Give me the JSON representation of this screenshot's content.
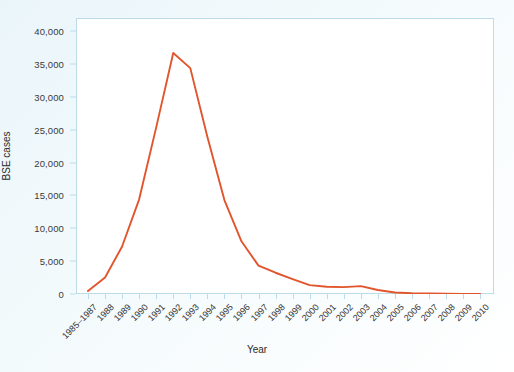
{
  "chart_data": {
    "type": "line",
    "title": "",
    "subtitle": "",
    "xlabel": "Year",
    "ylabel": "BSE cases",
    "categories": [
      "1985–1987",
      "1988",
      "1989",
      "1990",
      "1991",
      "1992",
      "1993",
      "1994",
      "1995",
      "1996",
      "1997",
      "1998",
      "1999",
      "2000",
      "2001",
      "2002",
      "2003",
      "2004",
      "2005",
      "2006",
      "2007",
      "2008",
      "2009",
      "2010"
    ],
    "values": [
      446,
      2514,
      7228,
      14407,
      25359,
      36682,
      34370,
      23945,
      14302,
      8016,
      4312,
      3235,
      2274,
      1357,
      1113,
      1044,
      1202,
      612,
      225,
      114,
      67,
      37,
      12,
      11
    ],
    "series": [
      {
        "name": "BSE cases",
        "color": "#e2552c",
        "values": [
          446,
          2514,
          7228,
          14407,
          25359,
          36682,
          34370,
          23945,
          14302,
          8016,
          4312,
          3235,
          2274,
          1357,
          1113,
          1044,
          1202,
          612,
          225,
          114,
          67,
          37,
          12,
          11
        ]
      }
    ],
    "ylim": [
      0,
      42000
    ],
    "yticks": [
      0,
      5000,
      10000,
      15000,
      20000,
      25000,
      30000,
      35000,
      40000
    ],
    "ytick_labels": [
      "0",
      "5,000",
      "10,000",
      "15,000",
      "20,000",
      "25,000",
      "30,000",
      "35,000",
      "40,000"
    ],
    "xlim_categories": 24,
    "grid": false,
    "legend": "none",
    "annotations": []
  },
  "style": {
    "line_color": "#e2552c",
    "frame_color": "#bcdcec",
    "text_color": "#333333",
    "plot_background": "#ffffff",
    "page_background": "#eef7fa"
  }
}
